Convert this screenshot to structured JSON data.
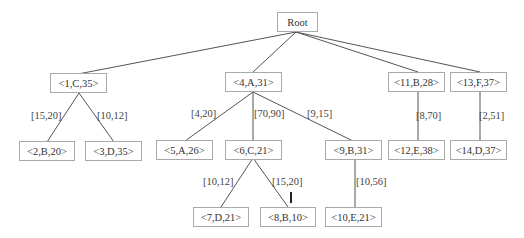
{
  "tree": {
    "root": {
      "label": "Root"
    },
    "nodes": {
      "n1": "<1,C,35>",
      "n2": "<2,B,20>",
      "n3": "<3,D,35>",
      "n4": "<4,A,31>",
      "n5": "<5,A,26>",
      "n6": "<6,C,21>",
      "n7": "<7,D,21>",
      "n8": "<8,B,10>",
      "n9": "<9,B,31>",
      "n10": "<10,E,21>",
      "n11": "<11,B,28>",
      "n12": "<12,E,38>",
      "n13": "<13,F,37>",
      "n14": "<14,D,37>"
    },
    "edges": {
      "n1_n2": "[15,20]",
      "n1_n3": "[10,12]",
      "n4_n5": "[4,20]",
      "n4_n6": "[70,90]",
      "n4_n9": "[9,15]",
      "n6_n7": "[10,12]",
      "n6_n8": "[15,20]",
      "n9_n10": "[10,56]",
      "n11_n12": "[8,70]",
      "n13_n14": "[2,51]"
    }
  }
}
